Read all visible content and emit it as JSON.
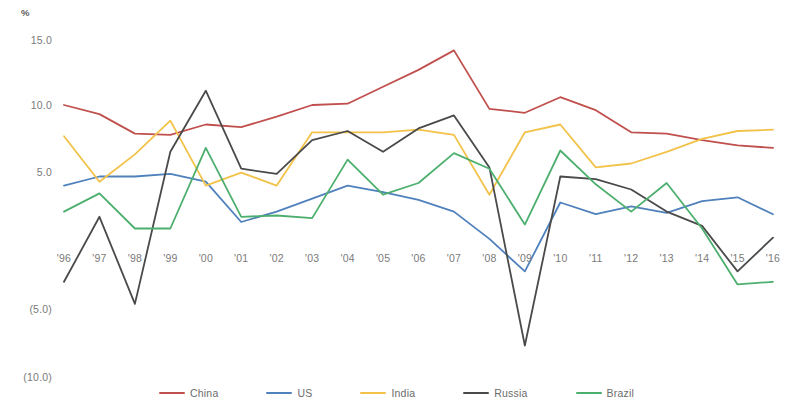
{
  "chart_data": {
    "type": "line",
    "title": "",
    "subtitle": "",
    "xlabel": "",
    "ylabel": "%",
    "unit_label": "%",
    "grid": false,
    "legend_position": "bottom",
    "xlim": [
      0,
      20
    ],
    "ylim": [
      -10.0,
      15.0
    ],
    "y_ticks": [
      "15.0",
      "10.0",
      "5.0",
      "(5.0)",
      "(10.0)"
    ],
    "y_tick_values": [
      15.0,
      10.0,
      5.0,
      -5.0,
      -10.0
    ],
    "categories": [
      "'96",
      "'97",
      "'98",
      "'99",
      "'00",
      "'01",
      "'02",
      "'03",
      "'04",
      "'05",
      "'06",
      "'07",
      "'08",
      "'09",
      "'10",
      "'11",
      "'12",
      "'13",
      "'14",
      "'15",
      "'16"
    ],
    "series": [
      {
        "name": "China",
        "color": "#C0504D",
        "values": [
          10.0,
          9.3,
          7.8,
          7.7,
          8.5,
          8.3,
          9.1,
          10.0,
          10.1,
          11.4,
          12.7,
          14.2,
          9.7,
          9.4,
          10.6,
          9.6,
          7.9,
          7.8,
          7.3,
          6.9,
          6.7
        ]
      },
      {
        "name": "US",
        "color": "#4F81BD",
        "values": [
          3.8,
          4.5,
          4.5,
          4.7,
          4.1,
          1.0,
          1.8,
          2.8,
          3.8,
          3.3,
          2.7,
          1.8,
          -0.3,
          -2.8,
          2.5,
          1.6,
          2.2,
          1.7,
          2.6,
          2.9,
          1.6
        ]
      },
      {
        "name": "India",
        "color": "#F2C249",
        "values": [
          7.6,
          4.1,
          6.2,
          8.8,
          3.8,
          4.8,
          3.8,
          7.9,
          7.9,
          7.9,
          8.1,
          7.7,
          3.1,
          7.9,
          8.5,
          5.2,
          5.5,
          6.4,
          7.4,
          8.0,
          8.1
        ]
      },
      {
        "name": "Russia",
        "color": "#4A4A4A",
        "values": [
          -3.6,
          1.4,
          -5.3,
          6.4,
          11.1,
          5.1,
          4.7,
          7.3,
          8.0,
          6.4,
          8.2,
          9.2,
          5.2,
          -8.5,
          4.5,
          4.3,
          3.5,
          1.8,
          0.7,
          -2.8,
          -0.2
        ]
      },
      {
        "name": "Brazil",
        "color": "#4DAF6E",
        "values": [
          1.8,
          3.2,
          0.5,
          0.5,
          6.7,
          1.4,
          1.5,
          1.3,
          5.8,
          3.1,
          4.0,
          6.3,
          5.1,
          0.8,
          6.5,
          3.9,
          1.8,
          4.0,
          0.5,
          -3.8,
          -3.6
        ]
      }
    ]
  }
}
